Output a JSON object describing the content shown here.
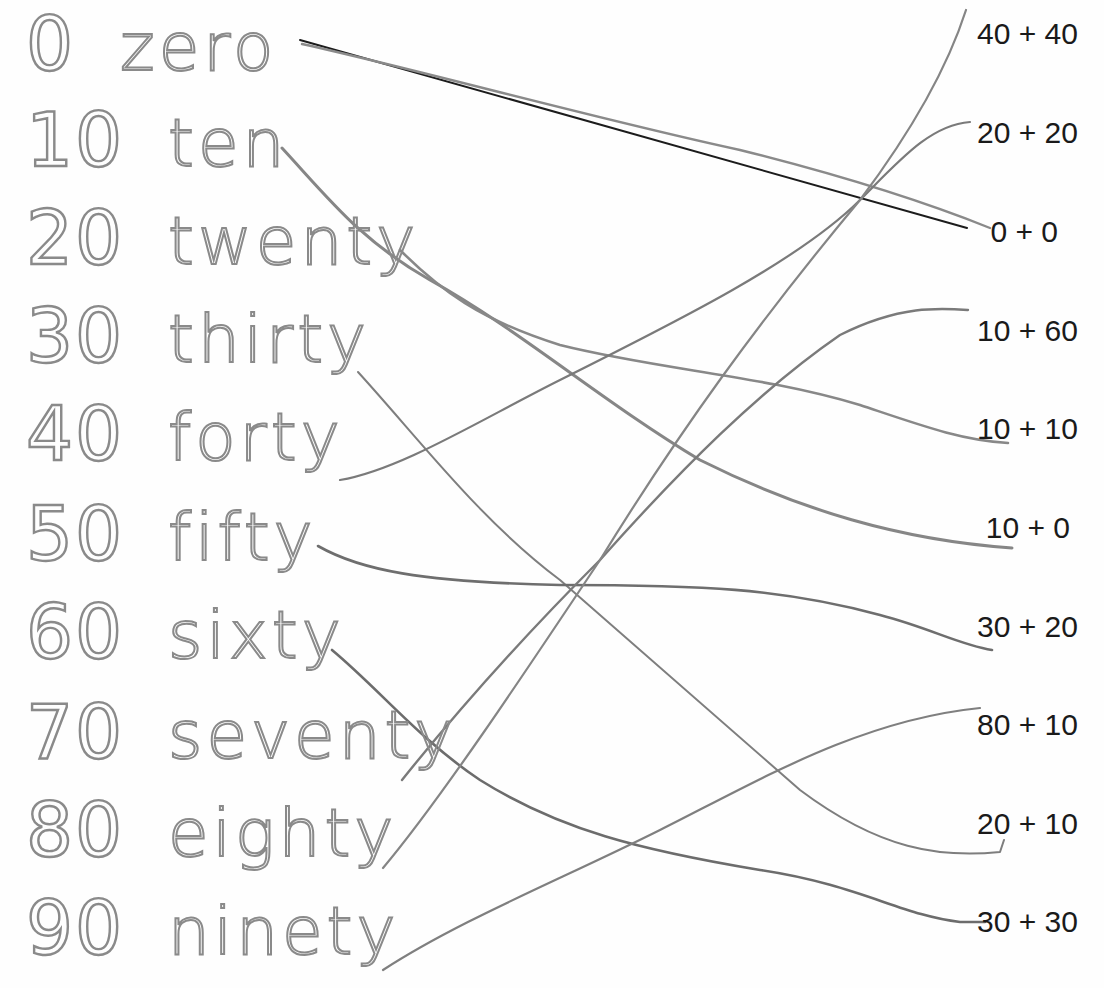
{
  "worksheet": {
    "left_items": [
      {
        "numeral": "0",
        "word": "zero"
      },
      {
        "numeral": "10",
        "word": "ten"
      },
      {
        "numeral": "20",
        "word": "twenty"
      },
      {
        "numeral": "30",
        "word": "thirty"
      },
      {
        "numeral": "40",
        "word": "forty"
      },
      {
        "numeral": "50",
        "word": "fifty"
      },
      {
        "numeral": "60",
        "word": "sixty"
      },
      {
        "numeral": "70",
        "word": "seventy"
      },
      {
        "numeral": "80",
        "word": "eighty"
      },
      {
        "numeral": "90",
        "word": "ninety"
      }
    ],
    "right_items": [
      "40 + 40",
      "20 + 20",
      "0 + 0",
      "10 + 60",
      "10 + 10",
      "10 + 0",
      "30 + 20",
      "80 + 10",
      "20 + 10",
      "30 + 30"
    ],
    "matches": [
      {
        "from": "zero",
        "to": "0 + 0"
      },
      {
        "from": "ten",
        "to": "10 + 0"
      },
      {
        "from": "twenty",
        "to": "10 + 10"
      },
      {
        "from": "thirty",
        "to": "20 + 10"
      },
      {
        "from": "forty",
        "to": "20 + 20"
      },
      {
        "from": "fifty",
        "to": "30 + 20"
      },
      {
        "from": "sixty",
        "to": "30 + 30"
      },
      {
        "from": "seventy",
        "to": "10 + 60"
      },
      {
        "from": "eighty",
        "to": "40 + 40"
      },
      {
        "from": "ninety",
        "to": "80 + 10"
      }
    ],
    "colors": {
      "pencil": "#7d7d7d",
      "dark_line": "#1c1c1c",
      "tracing": "#8a8a8a",
      "text": "#1a1a1a"
    }
  }
}
